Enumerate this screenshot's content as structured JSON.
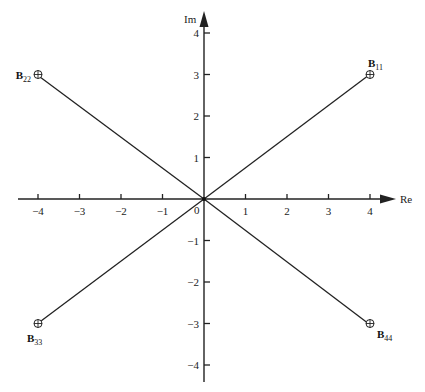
{
  "diagram": {
    "type": "complex-plane",
    "origin_px": [
      204,
      199
    ],
    "unit_px": 41.5,
    "axes": {
      "x": {
        "label": "Re",
        "ticks": [
          {
            "value": -4,
            "label": "−4"
          },
          {
            "value": -3,
            "label": "−3"
          },
          {
            "value": -2,
            "label": "−2"
          },
          {
            "value": -1,
            "label": "−1"
          },
          {
            "value": 1,
            "label": "1"
          },
          {
            "value": 2,
            "label": "2"
          },
          {
            "value": 3,
            "label": "3"
          },
          {
            "value": 4,
            "label": "4"
          }
        ]
      },
      "y": {
        "label": "Im",
        "ticks": [
          {
            "value": 4,
            "label": "4"
          },
          {
            "value": 3,
            "label": "3"
          },
          {
            "value": 2,
            "label": "2"
          },
          {
            "value": 1,
            "label": "1"
          },
          {
            "value": -1,
            "label": "−1"
          },
          {
            "value": -2,
            "label": "−2"
          },
          {
            "value": -3,
            "label": "−3"
          },
          {
            "value": -4,
            "label": "−4"
          }
        ]
      },
      "origin_label": "0"
    },
    "points": [
      {
        "name": "B",
        "sub": "11",
        "re": 4,
        "im": 3
      },
      {
        "name": "B",
        "sub": "22",
        "re": -4,
        "im": 3
      },
      {
        "name": "B",
        "sub": "33",
        "re": -4,
        "im": -3
      },
      {
        "name": "B",
        "sub": "44",
        "re": 4,
        "im": -3
      }
    ]
  }
}
